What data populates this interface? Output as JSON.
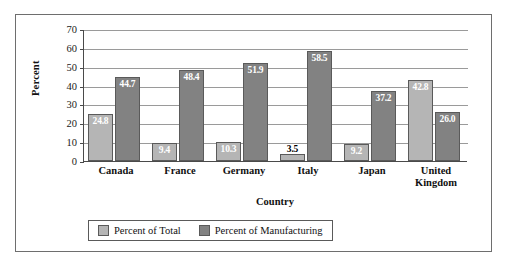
{
  "chart_data": {
    "type": "bar",
    "title": "",
    "subtitle": "",
    "xlabel": "Country",
    "ylabel": "Percent",
    "ylim": [
      0,
      70
    ],
    "ytick_step": 10,
    "yticks": [
      70,
      60,
      50,
      40,
      30,
      20,
      10,
      0
    ],
    "grid": true,
    "legend_position": "bottom",
    "categories": [
      "Canada",
      "France",
      "Germany",
      "Italy",
      "Japan",
      "United Kingdom"
    ],
    "series": [
      {
        "name": "Percent of Total",
        "color": "#b5b5b5",
        "values": [
          24.8,
          9.4,
          10.3,
          3.5,
          9.2,
          42.8
        ],
        "labels": [
          "24.8",
          "9.4",
          "10.3",
          "3.5",
          "9.2",
          "42.8"
        ]
      },
      {
        "name": "Percent of Manufacturing",
        "color": "#828282",
        "values": [
          44.7,
          48.4,
          51.9,
          58.5,
          37.2,
          26.0
        ],
        "labels": [
          "44.7",
          "48.4",
          "51.9",
          "58.5",
          "37.2",
          "26.0"
        ]
      }
    ]
  },
  "axis": {
    "y_title": "Percent",
    "x_title": "Country",
    "y_tick_labels": [
      "70",
      "60",
      "50",
      "40",
      "30",
      "20",
      "10",
      "0"
    ],
    "x_tick_labels": [
      "Canada",
      "France",
      "Germany",
      "Italy",
      "Japan",
      "United\nKingdom"
    ]
  },
  "legend": {
    "items": [
      {
        "label": "Percent of Total",
        "color": "#b5b5b5"
      },
      {
        "label": "Percent of Manufacturing",
        "color": "#828282"
      }
    ]
  }
}
